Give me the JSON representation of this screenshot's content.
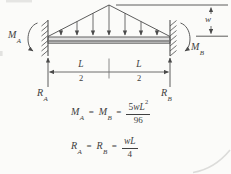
{
  "labels": {
    "moment_left": {
      "base": "M",
      "sub": "A"
    },
    "moment_right": {
      "base": "M",
      "sub": "B"
    },
    "reaction_left": {
      "base": "R",
      "sub": "A"
    },
    "reaction_right": {
      "base": "R",
      "sub": "B"
    },
    "load_intensity": "w",
    "span_left": {
      "num": "L",
      "den": "2"
    },
    "span_right": {
      "num": "L",
      "den": "2"
    }
  },
  "equations": {
    "moment": {
      "term1": {
        "base": "M",
        "sub": "A"
      },
      "equals1": "=",
      "term2": {
        "base": "M",
        "sub": "B"
      },
      "equals2": "=",
      "fraction": {
        "coefficient": "5",
        "variables": "wL",
        "exponent": "2",
        "denominator": "96"
      }
    },
    "reaction": {
      "term1": {
        "base": "R",
        "sub": "A"
      },
      "equals1": "=",
      "term2": {
        "base": "R",
        "sub": "B"
      },
      "equals2": "=",
      "fraction": {
        "coefficient": "",
        "variables": "wL",
        "exponent": "",
        "denominator": "4"
      }
    }
  },
  "colors": {
    "ink": "#404040",
    "line": "#4a4a4a",
    "beam_face": "#dedede",
    "beam_shade": "#929292",
    "beam_edge": "#555555",
    "background": "#fbfbf9",
    "artifact": "#dcdcda"
  }
}
